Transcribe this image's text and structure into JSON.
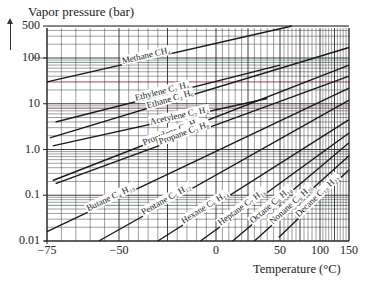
{
  "chart_data": {
    "type": "line",
    "title": "Vapor pressure (bar)",
    "xlabel": "Temperature (°C)",
    "ylabel": "Vapor pressure (bar)",
    "yscale": "log",
    "ylim": [
      0.01,
      500
    ],
    "xlim": [
      -75,
      150
    ],
    "grid": true,
    "x_ticks": [
      -75,
      -50,
      0,
      50,
      100,
      150
    ],
    "x_tick_labels": [
      "−75",
      "−50",
      "0",
      "50",
      "100",
      "150"
    ],
    "y_ticks": [
      500,
      100,
      10,
      1.0,
      0.1,
      0.01
    ],
    "y_tick_labels": [
      "500",
      "100",
      "10",
      "1.0",
      "0.1",
      "0.01"
    ],
    "series": [
      {
        "name": "Methane CH4",
        "label": "Methane CH₄",
        "points": [
          [
            -75,
            30
          ],
          [
            65,
            500
          ]
        ]
      },
      {
        "name": "Ethylene C2H4",
        "label": "Ethylene C₂ H₄",
        "points": [
          [
            -72,
            4.0
          ],
          [
            50,
            70
          ]
        ]
      },
      {
        "name": "Ethane C2H6",
        "label": "Ethane C₂ H₆",
        "points": [
          [
            -74,
            1.8
          ],
          [
            150,
            170
          ]
        ]
      },
      {
        "name": "Acetylene C2H2",
        "label": "Acetylene C₂ H₂",
        "points": [
          [
            -73,
            1.2
          ],
          [
            40,
            13
          ]
        ]
      },
      {
        "name": "Propylene C3H6",
        "label": "Propylene C₃ H₆",
        "points": [
          [
            -73,
            0.21
          ],
          [
            150,
            70
          ]
        ]
      },
      {
        "name": "Propane C3H8",
        "label": "Propane C₃ H₈",
        "points": [
          [
            -72,
            0.18
          ],
          [
            150,
            40
          ]
        ]
      },
      {
        "name": "Butane C4H10",
        "label": "Butane C₄ H₁₀",
        "points": [
          [
            -75,
            0.016
          ],
          [
            150,
            22
          ]
        ]
      },
      {
        "name": "Pentane C5H12",
        "label": "Pentane C₅ H₁₂",
        "points": [
          [
            -57,
            0.01
          ],
          [
            150,
            12
          ]
        ]
      },
      {
        "name": "Hexane C6H14",
        "label": "Hexane C₆ H₁₄",
        "points": [
          [
            -30,
            0.01
          ],
          [
            150,
            4.5
          ]
        ]
      },
      {
        "name": "Heptane C7H16",
        "label": "Heptane C₇ H₁₆",
        "points": [
          [
            -8,
            0.01
          ],
          [
            150,
            2.3
          ]
        ]
      },
      {
        "name": "Octane C8H18",
        "label": "Octane C₈ H₁₈",
        "points": [
          [
            13,
            0.01
          ],
          [
            150,
            1.4
          ]
        ]
      },
      {
        "name": "Nonane C9H20",
        "label": "Nonane C₉ H₂₀",
        "points": [
          [
            30,
            0.01
          ],
          [
            150,
            0.73
          ]
        ]
      },
      {
        "name": "Decane C10H22",
        "label": "Decane C₁₀ H₂₂",
        "points": [
          [
            49,
            0.012
          ],
          [
            150,
            0.36
          ]
        ]
      }
    ]
  },
  "title": "Vapor pressure (bar)",
  "xlabel": "Temperature (°C)",
  "colors": {
    "line": "#1a1a1a",
    "grid": "#2a2a2a",
    "accent_red": "#c0404a",
    "accent_green": "#5aa070",
    "accent_purple": "#7a3a80"
  }
}
